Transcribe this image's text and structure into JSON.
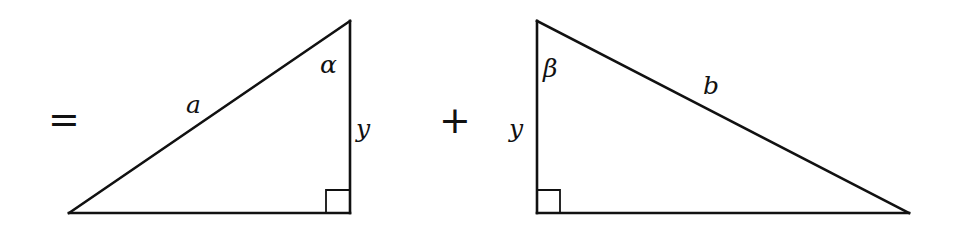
{
  "diagram": {
    "operators": {
      "equals": "=",
      "plus": "+"
    },
    "left_triangle": {
      "hypotenuse_label": "a",
      "angle_label": "α",
      "vertical_side_label": "y",
      "right_angle": "bottom-right",
      "vertices": [
        [
          69,
          213
        ],
        [
          350,
          21
        ],
        [
          350,
          213
        ]
      ]
    },
    "right_triangle": {
      "hypotenuse_label": "b",
      "angle_label": "β",
      "vertical_side_label": "y",
      "right_angle": "bottom-left",
      "vertices": [
        [
          537,
          21
        ],
        [
          909,
          213
        ],
        [
          537,
          213
        ]
      ]
    },
    "colors": {
      "stroke": "#111111",
      "background": "#ffffff"
    }
  }
}
